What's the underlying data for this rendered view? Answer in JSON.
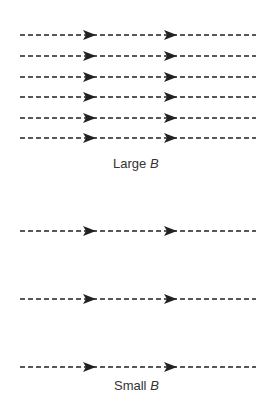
{
  "panels": [
    {
      "name": "large-b",
      "label_text": "Large ",
      "label_var": "B",
      "line_ys": [
        35,
        56,
        77,
        97,
        118,
        138
      ],
      "label_y": 156
    },
    {
      "name": "small-b",
      "label_text": "Small ",
      "label_var": "B",
      "line_ys": [
        231,
        299,
        367
      ],
      "label_y": 378
    }
  ],
  "line": {
    "x_start": 20,
    "x_end": 256,
    "arrow_xs": [
      83,
      164
    ],
    "color": "#222222"
  }
}
